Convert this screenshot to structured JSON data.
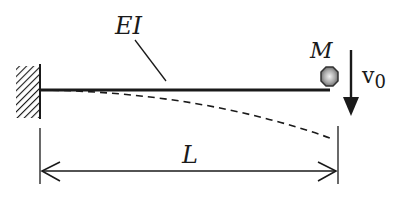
{
  "diagram": {
    "labels": {
      "stiffness": "EI",
      "mass": "M",
      "velocity": "v",
      "velocity_subscript": "0",
      "length": "L"
    },
    "components": {
      "support": "fixed-wall",
      "beam": "cantilever-beam",
      "deflection": "dashed-deflected-shape",
      "tip_mass": "point-mass",
      "velocity_arrow": "downward-arrow",
      "dimension": "length-dimension-line"
    },
    "colors": {
      "ink": "#1a1a1a",
      "mass_highlight": "#f2f2f2",
      "mass_shadow": "#555555"
    }
  }
}
